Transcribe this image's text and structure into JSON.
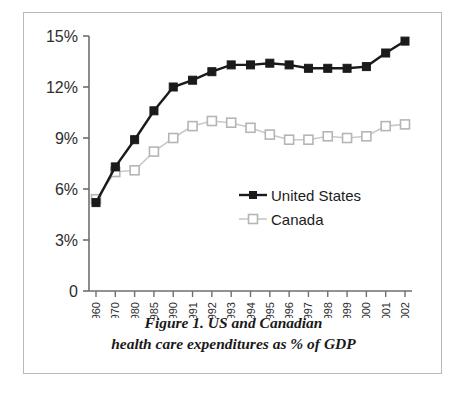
{
  "figure": {
    "caption_line_1": "Figure 1. US and Canadian",
    "caption_line_2": "health care expenditures as % of GDP"
  },
  "chart_data": {
    "type": "line",
    "title": "Figure 1. US and Canadian health care expenditures as % of GDP",
    "xlabel": "",
    "ylabel": "",
    "categories": [
      "1960",
      "1970",
      "1980",
      "1985",
      "1990",
      "1991",
      "1992",
      "1993",
      "1994",
      "1995",
      "1996",
      "1997",
      "1998",
      "1999",
      "2000",
      "2001",
      "2002"
    ],
    "series": [
      {
        "name": "United States",
        "color": "#1a1a1a",
        "marker": "filled-square",
        "values": [
          5.2,
          7.3,
          8.9,
          10.6,
          12.0,
          12.4,
          12.9,
          13.3,
          13.3,
          13.4,
          13.3,
          13.1,
          13.1,
          13.1,
          13.2,
          14.0,
          14.7
        ]
      },
      {
        "name": "Canada",
        "color": "#c9c9c9",
        "marker": "open-square",
        "values": [
          5.4,
          7.0,
          7.1,
          8.2,
          9.0,
          9.7,
          10.0,
          9.9,
          9.6,
          9.2,
          8.9,
          8.9,
          9.1,
          9.0,
          9.1,
          9.7,
          9.8
        ]
      }
    ],
    "y_ticks": [
      {
        "value": 0,
        "label": "0"
      },
      {
        "value": 3,
        "label": "3%"
      },
      {
        "value": 6,
        "label": "6%"
      },
      {
        "value": 9,
        "label": "9%"
      },
      {
        "value": 12,
        "label": "12%"
      },
      {
        "value": 15,
        "label": "15%"
      }
    ],
    "ylim": [
      0,
      15
    ],
    "grid": false,
    "legend_position": "inside-right",
    "legend_entries": [
      "United States",
      "Canada"
    ]
  },
  "legend": {
    "items": [
      {
        "label": "United States"
      },
      {
        "label": "Canada"
      }
    ]
  }
}
